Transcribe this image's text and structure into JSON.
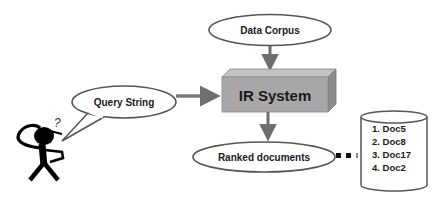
{
  "diagram": {
    "nodes": {
      "data_corpus": {
        "label": "Data Corpus",
        "shape": "ellipse"
      },
      "ir_system": {
        "label": "IR System",
        "shape": "3d-box"
      },
      "query_string": {
        "label": "Query String",
        "shape": "speech-callout"
      },
      "ranked_documents": {
        "label": "Ranked documents",
        "shape": "ellipse"
      },
      "result_store": {
        "shape": "cylinder",
        "items": [
          "1. Doc5",
          "2. Doc8",
          "3. Doc17",
          "4. Doc2"
        ]
      },
      "user": {
        "shape": "stick-figure",
        "annotation": "?"
      }
    },
    "edges": [
      {
        "from": "data_corpus",
        "to": "ir_system",
        "style": "arrow"
      },
      {
        "from": "query_string",
        "to": "ir_system",
        "style": "arrow"
      },
      {
        "from": "ir_system",
        "to": "ranked_documents",
        "style": "arrow"
      },
      {
        "from": "ranked_documents",
        "to": "result_store",
        "style": "dotted"
      }
    ],
    "colors": {
      "arrow": "#6e6e6e",
      "box_front": "#a9a9a9",
      "box_top": "#c4c4c4",
      "box_side": "#8a8a8a",
      "outline": "#555555",
      "figure": "#000000"
    }
  }
}
